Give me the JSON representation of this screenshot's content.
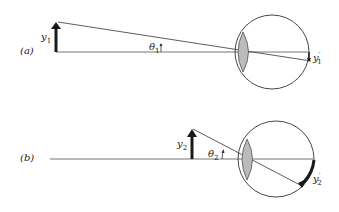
{
  "panels": [
    {
      "id": "a",
      "label": "(a)",
      "object_label": "y",
      "object_sub": "1",
      "angle_label": "θ",
      "angle_sub": "1",
      "image_label": "y",
      "image_prime": "′",
      "image_sub": "1"
    },
    {
      "id": "b",
      "label": "(b)",
      "object_label": "y",
      "object_sub": "2",
      "angle_label": "θ",
      "angle_sub": "2",
      "image_label": "y",
      "image_prime": "′",
      "image_sub": "2"
    }
  ],
  "colors": {
    "line": "#333333",
    "axis": "#555555",
    "lens": "#b8b8b8",
    "arrow": "#1a1a1a"
  }
}
